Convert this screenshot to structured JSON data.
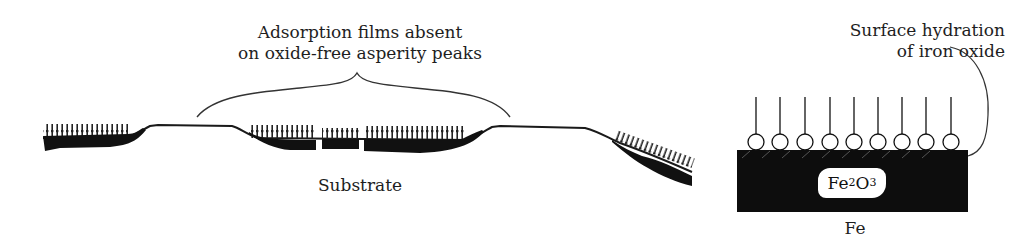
{
  "figure": {
    "left_panel": {
      "annotation_line1": "Adsorption films absent",
      "annotation_line2": "on oxide-free asperity peaks",
      "substrate_label": "Substrate"
    },
    "right_panel": {
      "annotation_line1": "Surface hydration",
      "annotation_line2": "of iron oxide",
      "oxide_label_main": "Fe",
      "oxide_sub1": "2",
      "oxide_mid": "O",
      "oxide_sub2": "3",
      "metal_label": "Fe",
      "adsorbed_molecule_count": 9
    },
    "colors": {
      "ink": "#111111",
      "background": "#ffffff"
    }
  }
}
